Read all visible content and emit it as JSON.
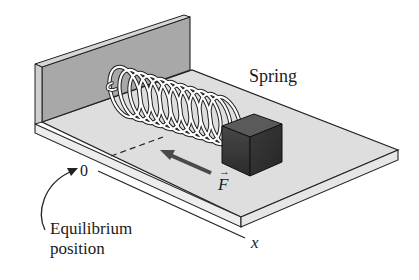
{
  "figure": {
    "labels": {
      "spring": "Spring",
      "force": "F",
      "force_vector_mark": "→",
      "origin": "0",
      "axis": "x",
      "equilibrium_line1": "Equilibrium",
      "equilibrium_line2": "position"
    },
    "colors": {
      "wall": "#a9a9a9",
      "wall_edge": "#d4d4d4",
      "platform_top": "#dcdcdc",
      "platform_edge": "#f0f0f0",
      "block_front": "#3a3a3a",
      "block_side": "#2a2a2a",
      "block_top": "#555555",
      "spring": "#ffffff",
      "force_arrow": "#4a4a4a",
      "outline": "#222222"
    }
  }
}
